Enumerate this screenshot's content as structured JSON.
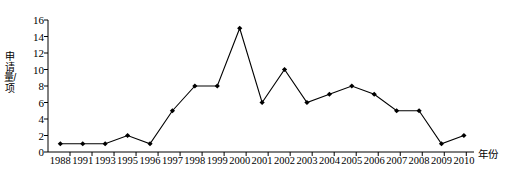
{
  "chart_data": {
    "type": "line",
    "title": "",
    "xlabel": "年份",
    "ylabel": "申请量/项",
    "categories": [
      "1988",
      "1991",
      "1993",
      "1995",
      "1996",
      "1997",
      "1998",
      "1999",
      "2000",
      "2001",
      "2002",
      "2003",
      "2004",
      "2005",
      "2006",
      "2007",
      "2008",
      "2009",
      "2010"
    ],
    "values": [
      1,
      1,
      1,
      2,
      1,
      5,
      8,
      8,
      15,
      6,
      10,
      6,
      7,
      8,
      7,
      5,
      5,
      1,
      2
    ],
    "series": [
      {
        "name": "申请量",
        "values": [
          1,
          1,
          1,
          2,
          1,
          5,
          8,
          8,
          15,
          6,
          10,
          6,
          7,
          8,
          7,
          5,
          5,
          1,
          2
        ]
      }
    ],
    "ylim": [
      0,
      16
    ],
    "yticks": [
      0,
      2,
      4,
      6,
      8,
      10,
      12,
      14,
      16
    ],
    "ytick_labels": [
      "0",
      "2",
      "4",
      "6",
      "8",
      "10",
      "12",
      "14",
      "16"
    ],
    "grid": false,
    "legend": "none",
    "marker": "diamond",
    "line_color": "#000000",
    "marker_color": "#000000",
    "axis_color": "#000000"
  }
}
